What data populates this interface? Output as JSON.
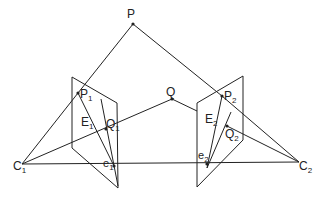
{
  "points": {
    "P": {
      "label": "P",
      "sub": ""
    },
    "Q": {
      "label": "Q",
      "sub": ""
    },
    "P1": {
      "label": "P",
      "sub": "1"
    },
    "Q1": {
      "label": "Q",
      "sub": "1"
    },
    "E1": {
      "label": "E",
      "sub": "1"
    },
    "e1": {
      "label": "e",
      "sub": "1"
    },
    "C1": {
      "label": "C",
      "sub": "1"
    },
    "P2": {
      "label": "P",
      "sub": "2"
    },
    "Q2": {
      "label": "Q",
      "sub": "2"
    },
    "E2": {
      "label": "E",
      "sub": "2"
    },
    "e2": {
      "label": "e",
      "sub": "2"
    },
    "C2": {
      "label": "C",
      "sub": "2"
    }
  },
  "colors": {
    "line": "#222222",
    "background": "#ffffff"
  }
}
